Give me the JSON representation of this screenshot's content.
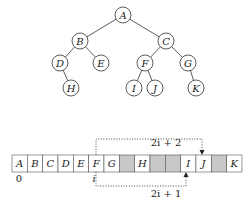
{
  "tree": {
    "nodes": [
      {
        "id": "A",
        "x": 123,
        "y": 15
      },
      {
        "id": "B",
        "x": 80,
        "y": 41
      },
      {
        "id": "C",
        "x": 166,
        "y": 41
      },
      {
        "id": "D",
        "x": 60,
        "y": 63
      },
      {
        "id": "E",
        "x": 101,
        "y": 63
      },
      {
        "id": "F",
        "x": 145,
        "y": 63
      },
      {
        "id": "G",
        "x": 188,
        "y": 63
      },
      {
        "id": "H",
        "x": 71,
        "y": 88
      },
      {
        "id": "I",
        "x": 134,
        "y": 88
      },
      {
        "id": "J",
        "x": 155,
        "y": 88
      },
      {
        "id": "K",
        "x": 196,
        "y": 88
      }
    ],
    "edges": [
      [
        "A",
        "B"
      ],
      [
        "A",
        "C"
      ],
      [
        "B",
        "D"
      ],
      [
        "B",
        "E"
      ],
      [
        "C",
        "F"
      ],
      [
        "C",
        "G"
      ],
      [
        "D",
        "H"
      ],
      [
        "F",
        "I"
      ],
      [
        "F",
        "J"
      ],
      [
        "G",
        "K"
      ]
    ]
  },
  "array": {
    "cells": [
      "A",
      "B",
      "C",
      "D",
      "E",
      "F",
      "G",
      "",
      "H",
      "",
      "",
      "I",
      "J",
      "",
      "K"
    ],
    "index_zero_label": "0",
    "index_i_label": "i",
    "top_formula": "2i + 2",
    "bottom_formula": "2i + 1"
  },
  "colors": {
    "empty_cell": "#c8c8c8",
    "stroke": "#333333"
  }
}
